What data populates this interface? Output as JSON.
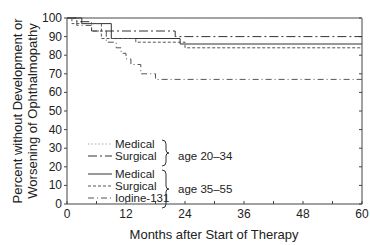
{
  "chart_data": {
    "type": "line",
    "subtype": "step (Kaplan-Meier)",
    "title": "",
    "xlabel": "Months after Start of Therapy",
    "ylabel_line1": "Percent without Development or",
    "ylabel_line2": "Worsening of Ophthalmopathy",
    "xlim": [
      0,
      60
    ],
    "ylim": [
      0,
      100
    ],
    "xticks": [
      0,
      12,
      24,
      36,
      48,
      60
    ],
    "yticks": [
      0,
      10,
      20,
      30,
      40,
      50,
      60,
      70,
      80,
      90,
      100
    ],
    "grid": false,
    "legend": {
      "position": "lower-left inside",
      "groups": [
        {
          "label": "age 20–34",
          "entries": [
            "Medical",
            "Surgical"
          ]
        },
        {
          "label": "age 35–55",
          "entries": [
            "Medical",
            "Surgical",
            "Iodine-131"
          ]
        }
      ]
    },
    "series": [
      {
        "name": "Medical (age 20–34)",
        "style": "light-dotted",
        "points": [
          [
            0,
            100
          ],
          [
            60,
            100
          ]
        ]
      },
      {
        "name": "Surgical (age 20–34)",
        "style": "long-dash",
        "points": [
          [
            0,
            100
          ],
          [
            2,
            100
          ],
          [
            2,
            98
          ],
          [
            5,
            98
          ],
          [
            5,
            93
          ],
          [
            22,
            93
          ],
          [
            22,
            90
          ],
          [
            60,
            90
          ]
        ]
      },
      {
        "name": "Medical (age 35–55)",
        "style": "solid",
        "points": [
          [
            0,
            100
          ],
          [
            3,
            100
          ],
          [
            3,
            97
          ],
          [
            9,
            97
          ],
          [
            9,
            89
          ],
          [
            23,
            89
          ],
          [
            23,
            86
          ],
          [
            60,
            86
          ]
        ]
      },
      {
        "name": "Surgical (age 35–55)",
        "style": "short-dash",
        "points": [
          [
            0,
            100
          ],
          [
            1,
            100
          ],
          [
            1,
            97
          ],
          [
            7,
            97
          ],
          [
            7,
            89
          ],
          [
            14,
            89
          ],
          [
            14,
            87
          ],
          [
            24,
            87
          ],
          [
            24,
            84
          ],
          [
            60,
            84
          ]
        ]
      },
      {
        "name": "Iodine-131 (age 35–55)",
        "style": "dash-dot",
        "points": [
          [
            0,
            100
          ],
          [
            2,
            100
          ],
          [
            2,
            96
          ],
          [
            5,
            96
          ],
          [
            5,
            93
          ],
          [
            8,
            93
          ],
          [
            8,
            87
          ],
          [
            10,
            87
          ],
          [
            10,
            84
          ],
          [
            11,
            84
          ],
          [
            11,
            81
          ],
          [
            12,
            81
          ],
          [
            12,
            78
          ],
          [
            13,
            78
          ],
          [
            13,
            75
          ],
          [
            15,
            75
          ],
          [
            15,
            70
          ],
          [
            18,
            70
          ],
          [
            18,
            67
          ],
          [
            60,
            67
          ]
        ]
      }
    ]
  }
}
